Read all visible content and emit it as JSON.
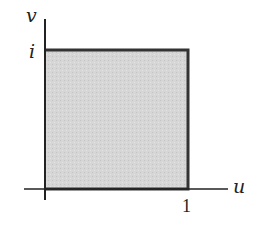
{
  "diagram": {
    "type": "region-in-complex-plane",
    "axes": {
      "horizontal_label": "u",
      "vertical_label": "v"
    },
    "ticks": {
      "horizontal": "1",
      "vertical": "i"
    },
    "region": {
      "shape": "square",
      "corners": [
        "0",
        "1",
        "1+i",
        "i"
      ],
      "fill_color": "#d4d4d4",
      "border_color": "#333333"
    },
    "colors": {
      "axis": "#222222",
      "text": "#222222",
      "background": "#ffffff"
    }
  }
}
